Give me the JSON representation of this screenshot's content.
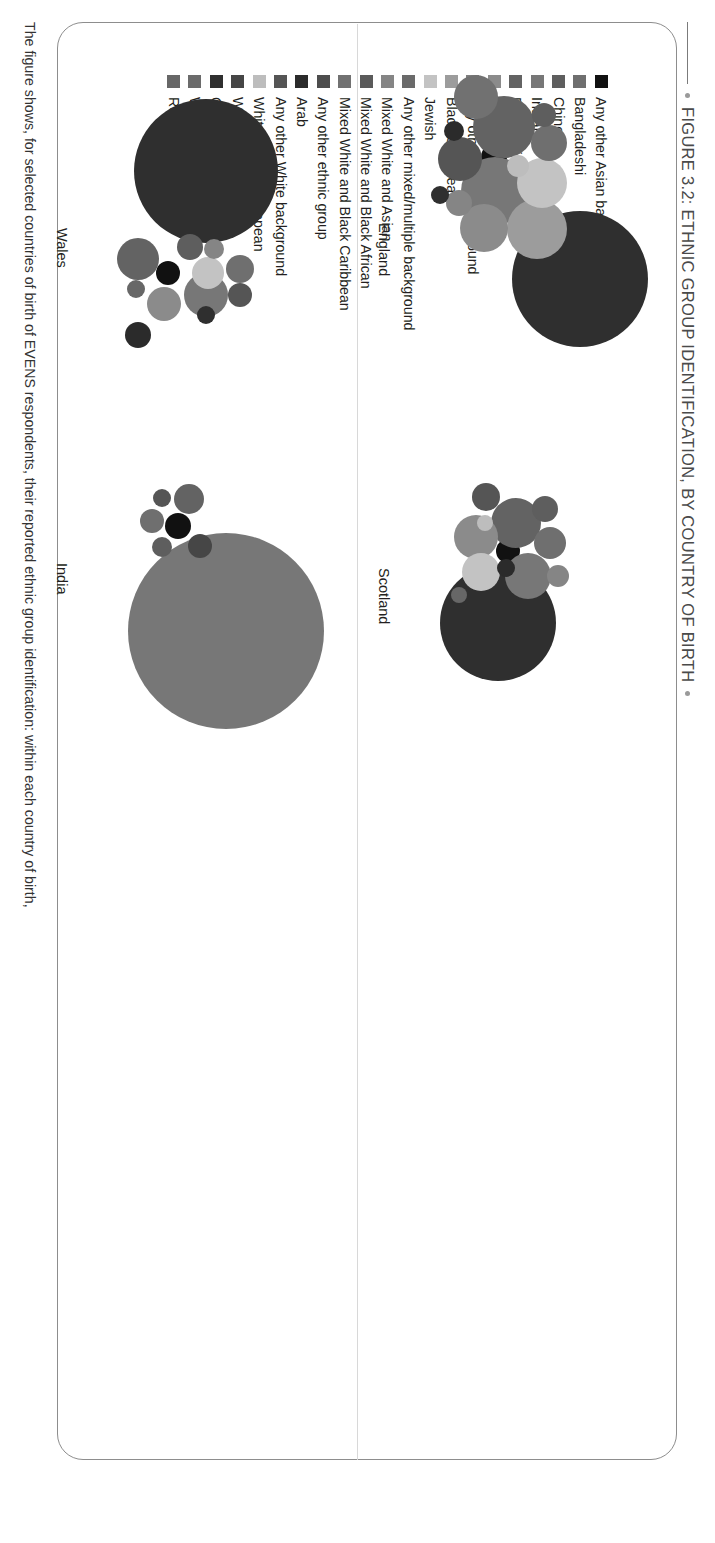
{
  "figure": {
    "title": "FIGURE 3.2: ETHNIC GROUP IDENTIFICATION, BY COUNTRY OF BIRTH",
    "caption": "The figure shows, for selected countries of birth of EVENS respondents, their reported ethnic group identification: within each country of birth,"
  },
  "legend": {
    "items": [
      {
        "label": "Any other Asian background",
        "color": "#111111"
      },
      {
        "label": "Bangladeshi",
        "color": "#6f6f6f"
      },
      {
        "label": "Chinese",
        "color": "#5e5e5e"
      },
      {
        "label": "Indian",
        "color": "#777777"
      },
      {
        "label": "Pakistani",
        "color": "#636363"
      },
      {
        "label": "Black African",
        "color": "#8b8b8b"
      },
      {
        "label": "Any other Black background",
        "color": "#7f7f7f"
      },
      {
        "label": "Black Caribbean",
        "color": "#9c9c9c"
      },
      {
        "label": "Jewish",
        "color": "#c3c3c3"
      },
      {
        "label": "Any other mixed/multiple background",
        "color": "#6a6a6a"
      },
      {
        "label": "Mixed White and Asian",
        "color": "#858585"
      },
      {
        "label": "Mixed White and Black African",
        "color": "#5a5a5a"
      },
      {
        "label": "Mixed White and Black Caribbean",
        "color": "#717171"
      },
      {
        "label": "Any other ethnic group",
        "color": "#4d4d4d"
      },
      {
        "label": "Arab",
        "color": "#2b2b2b"
      },
      {
        "label": "Any other White background",
        "color": "#555555"
      },
      {
        "label": "White Eastern European",
        "color": "#bdbdbd"
      },
      {
        "label": "White British",
        "color": "#464646"
      },
      {
        "label": "Gypsy/Traveller",
        "color": "#2f2f2f"
      },
      {
        "label": "White Irish",
        "color": "#6b6b6b"
      },
      {
        "label": "Roma",
        "color": "#676767"
      }
    ]
  },
  "chart_data": {
    "type": "bubble",
    "title": "FIGURE 3.2: ETHNIC GROUP IDENTIFICATION, BY COUNTRY OF BIRTH",
    "xlabel": "",
    "ylabel": "",
    "legend_position": "left",
    "grid": false,
    "panels": [
      {
        "name": "England",
        "label": "England",
        "label_left": 200,
        "label_top": 284,
        "bubbles": [
          {
            "group": "White British",
            "color": "#2f2f2f",
            "cx": 256,
            "cy": 96,
            "r": 68
          },
          {
            "group": "Any other Asian background",
            "color": "#111111",
            "cx": 134,
            "cy": 182,
            "r": 13
          },
          {
            "group": "Pakistani",
            "color": "#636363",
            "cx": 104,
            "cy": 172,
            "r": 31
          },
          {
            "group": "Indian",
            "color": "#777777",
            "cx": 168,
            "cy": 181,
            "r": 34
          },
          {
            "group": "Black Caribbean",
            "color": "#9c9c9c",
            "cx": 206,
            "cy": 139,
            "r": 30
          },
          {
            "group": "Jewish",
            "color": "#c3c3c3",
            "cx": 160,
            "cy": 134,
            "r": 25
          },
          {
            "group": "Bangladeshi",
            "color": "#6f6f6f",
            "cx": 120,
            "cy": 127,
            "r": 18
          },
          {
            "group": "Black African",
            "color": "#8b8b8b",
            "cx": 205,
            "cy": 192,
            "r": 24
          },
          {
            "group": "Mixed White and Black Caribbean",
            "color": "#717171",
            "cx": 74,
            "cy": 200,
            "r": 22
          },
          {
            "group": "Any other White background",
            "color": "#555555",
            "cx": 136,
            "cy": 216,
            "r": 22
          },
          {
            "group": "Chinese",
            "color": "#5e5e5e",
            "cx": 92,
            "cy": 132,
            "r": 12
          },
          {
            "group": "White Eastern European",
            "color": "#bdbdbd",
            "cx": 143,
            "cy": 158,
            "r": 11
          },
          {
            "group": "Mixed White and Asian",
            "color": "#858585",
            "cx": 180,
            "cy": 217,
            "r": 13
          },
          {
            "group": "Arab",
            "color": "#2b2b2b",
            "cx": 108,
            "cy": 222,
            "r": 10
          },
          {
            "group": "Gypsy/Traveller",
            "color": "#2f2f2f",
            "cx": 172,
            "cy": 236,
            "r": 9
          }
        ]
      },
      {
        "name": "Scotland",
        "label": "Scotland",
        "label_left": 545,
        "label_top": 284,
        "bubbles": [
          {
            "group": "White British",
            "color": "#2f2f2f",
            "cx": 600,
            "cy": 178,
            "r": 58
          },
          {
            "group": "Any other Asian background",
            "color": "#111111",
            "cx": 528,
            "cy": 168,
            "r": 12
          },
          {
            "group": "Pakistani",
            "color": "#636363",
            "cx": 500,
            "cy": 160,
            "r": 25
          },
          {
            "group": "Indian",
            "color": "#777777",
            "cx": 553,
            "cy": 148,
            "r": 23
          },
          {
            "group": "Black African",
            "color": "#8b8b8b",
            "cx": 514,
            "cy": 200,
            "r": 22
          },
          {
            "group": "Jewish",
            "color": "#c3c3c3",
            "cx": 549,
            "cy": 195,
            "r": 19
          },
          {
            "group": "Bangladeshi",
            "color": "#6f6f6f",
            "cx": 520,
            "cy": 126,
            "r": 16
          },
          {
            "group": "Chinese",
            "color": "#5e5e5e",
            "cx": 486,
            "cy": 131,
            "r": 13
          },
          {
            "group": "Any other White background",
            "color": "#555555",
            "cx": 474,
            "cy": 190,
            "r": 14
          },
          {
            "group": "Mixed White and Asian",
            "color": "#858585",
            "cx": 553,
            "cy": 118,
            "r": 11
          },
          {
            "group": "Arab",
            "color": "#2b2b2b",
            "cx": 545,
            "cy": 170,
            "r": 9
          },
          {
            "group": "White Eastern European",
            "color": "#bdbdbd",
            "cx": 500,
            "cy": 191,
            "r": 8
          },
          {
            "group": "Roma",
            "color": "#676767",
            "cx": 572,
            "cy": 217,
            "r": 8
          }
        ]
      },
      {
        "name": "Wales",
        "label": "Wales",
        "label_left": 205,
        "label_top": 606,
        "bubbles": [
          {
            "group": "White British",
            "color": "#2f2f2f",
            "cx": 148,
            "cy": 470,
            "r": 72
          },
          {
            "group": "Any other Asian background",
            "color": "#111111",
            "cx": 250,
            "cy": 508,
            "r": 12
          },
          {
            "group": "Indian",
            "color": "#777777",
            "cx": 272,
            "cy": 470,
            "r": 22
          },
          {
            "group": "Pakistani",
            "color": "#636363",
            "cx": 236,
            "cy": 538,
            "r": 21
          },
          {
            "group": "Jewish",
            "color": "#c3c3c3",
            "cx": 250,
            "cy": 468,
            "r": 16
          },
          {
            "group": "Black African",
            "color": "#8b8b8b",
            "cx": 281,
            "cy": 512,
            "r": 17
          },
          {
            "group": "Bangladeshi",
            "color": "#6f6f6f",
            "cx": 246,
            "cy": 436,
            "r": 14
          },
          {
            "group": "Any other White background",
            "color": "#555555",
            "cx": 272,
            "cy": 436,
            "r": 12
          },
          {
            "group": "Chinese",
            "color": "#5e5e5e",
            "cx": 224,
            "cy": 486,
            "r": 13
          },
          {
            "group": "Arab",
            "color": "#2b2b2b",
            "cx": 312,
            "cy": 538,
            "r": 13
          },
          {
            "group": "Mixed White and Asian",
            "color": "#858585",
            "cx": 226,
            "cy": 462,
            "r": 10
          },
          {
            "group": "Gypsy/Traveller",
            "color": "#2f2f2f",
            "cx": 292,
            "cy": 470,
            "r": 9
          },
          {
            "group": "Roma",
            "color": "#676767",
            "cx": 266,
            "cy": 540,
            "r": 9
          }
        ]
      },
      {
        "name": "India",
        "label": "India",
        "label_left": 540,
        "label_top": 606,
        "bubbles": [
          {
            "group": "Indian",
            "color": "#777777",
            "cx": 608,
            "cy": 450,
            "r": 98
          },
          {
            "group": "Any other Asian background",
            "color": "#111111",
            "cx": 503,
            "cy": 498,
            "r": 13
          },
          {
            "group": "Pakistani",
            "color": "#636363",
            "cx": 476,
            "cy": 487,
            "r": 15
          },
          {
            "group": "White British",
            "color": "#464646",
            "cx": 523,
            "cy": 476,
            "r": 12
          },
          {
            "group": "Bangladeshi",
            "color": "#6f6f6f",
            "cx": 498,
            "cy": 524,
            "r": 12
          },
          {
            "group": "Chinese",
            "color": "#5e5e5e",
            "cx": 524,
            "cy": 514,
            "r": 10
          },
          {
            "group": "Any other White background",
            "color": "#555555",
            "cx": 475,
            "cy": 514,
            "r": 9
          }
        ]
      }
    ]
  }
}
